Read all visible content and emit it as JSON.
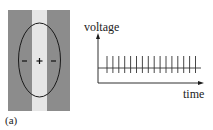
{
  "figure": {
    "panel_label": "(a)",
    "left_panel": {
      "description": "Receptive field: grey surround with light central strip; ellipse with center + and flanking - signs",
      "center_sign": "+",
      "surround_signs": [
        "−",
        "−"
      ],
      "colors": {
        "surround": "#8c8c8c",
        "strip": "#e6e6e6",
        "outline": "#1a1a1a"
      }
    },
    "right_panel": {
      "ylabel": "voltage",
      "xlabel": "time",
      "spike_count": 16,
      "axis_color": "#1a1a1a"
    }
  }
}
